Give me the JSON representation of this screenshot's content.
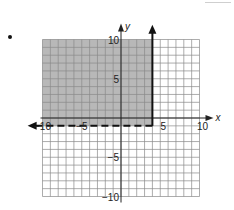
{
  "bullet": "•",
  "chart_data": {
    "type": "inequality-graph",
    "title": "",
    "xlabel": "x",
    "ylabel": "y",
    "xlim": [
      -10,
      10
    ],
    "ylim": [
      -10,
      10
    ],
    "grid": true,
    "x_ticks": [
      {
        "value": -10,
        "label": "−10"
      },
      {
        "value": -5,
        "label": "−5"
      },
      {
        "value": 5,
        "label": "5"
      },
      {
        "value": 10,
        "label": "10"
      }
    ],
    "y_ticks": [
      {
        "value": 10,
        "label": "10"
      },
      {
        "value": 5,
        "label": "5"
      },
      {
        "value": -5,
        "label": "−5"
      },
      {
        "value": -10,
        "label": "−10"
      }
    ],
    "boundaries": [
      {
        "equation": "x = 4",
        "style": "solid",
        "arrow": "up",
        "from": [
          4,
          -1
        ],
        "to": [
          4,
          11
        ]
      },
      {
        "equation": "y = -1",
        "style": "dashed",
        "arrow": "left",
        "from": [
          4,
          -1
        ],
        "to": [
          -11,
          -1
        ]
      }
    ],
    "shaded_region": {
      "description": "x < 4 and y > -1",
      "x_range": [
        -10,
        4
      ],
      "y_range": [
        -1,
        10
      ],
      "color": "#b8b8b8"
    },
    "system": [
      "x ≤ 4",
      "y > −1"
    ]
  }
}
